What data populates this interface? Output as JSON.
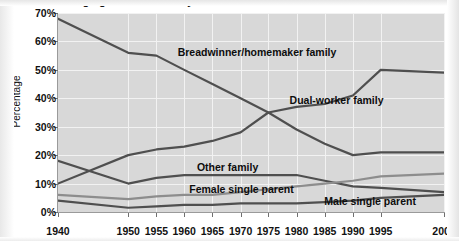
{
  "chart_data": {
    "type": "line",
    "title": "Changing American family structure",
    "xlabel": "",
    "ylabel": "Percentage",
    "categories": [
      "1940",
      "1950",
      "1955",
      "1960",
      "1965",
      "1970",
      "1975",
      "1980",
      "1985",
      "1990",
      "1995",
      "2000"
    ],
    "x_positions_pct": [
      0,
      18.2,
      25.5,
      32.7,
      40.0,
      47.3,
      54.5,
      61.8,
      69.1,
      76.4,
      83.6,
      100
    ],
    "ylim": [
      0,
      70
    ],
    "yticks": [
      "0%",
      "10%",
      "20%",
      "30%",
      "40%",
      "50%",
      "60%",
      "70%"
    ],
    "ytick_values": [
      0,
      10,
      20,
      30,
      40,
      50,
      60,
      70
    ],
    "grid": true,
    "legend_position": "inline-labels",
    "series": [
      {
        "name": "Breadwinner/homemaker family",
        "color": "#4f4f4f",
        "label_x_pct": 31,
        "label_y_pct": 17,
        "values": [
          68,
          56,
          55,
          50,
          45,
          40,
          35,
          29,
          24,
          20,
          21,
          21
        ]
      },
      {
        "name": "Dual-worker family",
        "color": "#4f4f4f",
        "label_x_pct": 60,
        "label_y_pct": 41,
        "values": [
          10,
          20,
          22,
          23,
          25,
          28,
          35,
          37,
          38,
          41,
          50,
          49
        ]
      },
      {
        "name": "Other family",
        "color": "#4f4f4f",
        "label_x_pct": 36,
        "label_y_pct": 75,
        "values": [
          18,
          10,
          12,
          13,
          13,
          13,
          13,
          13,
          11,
          9,
          8.5,
          7
        ]
      },
      {
        "name": "Female single parent",
        "color": "#8d8d8d",
        "label_x_pct": 34,
        "label_y_pct": 86,
        "values": [
          6,
          4.5,
          5.5,
          6,
          6,
          7,
          8,
          9,
          10,
          11,
          12.5,
          13.5
        ]
      },
      {
        "name": "Male single parent",
        "color": "#4f4f4f",
        "label_x_pct": 69,
        "label_y_pct": 92,
        "values": [
          4,
          1.5,
          2,
          2.5,
          2.5,
          3,
          3,
          3,
          3.5,
          4,
          5,
          6
        ]
      }
    ]
  }
}
